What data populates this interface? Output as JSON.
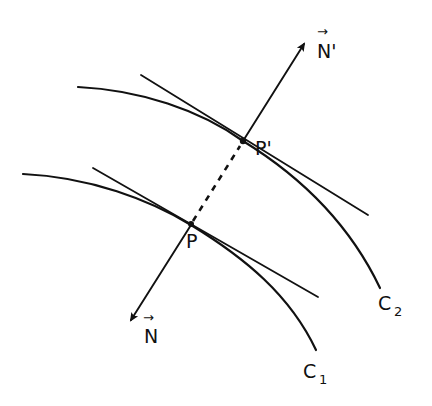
{
  "diagram": {
    "type": "parallel-curves-normals",
    "stroke_color": "#111111",
    "background": "#ffffff",
    "curves": [
      {
        "id": "C1",
        "label": "C",
        "subscript": "1"
      },
      {
        "id": "C2",
        "label": "C",
        "subscript": "2"
      }
    ],
    "points": [
      {
        "id": "P",
        "label": "P"
      },
      {
        "id": "P_prime",
        "label": "P'"
      }
    ],
    "vectors": [
      {
        "id": "N",
        "label": "N",
        "arrow_over": true,
        "direction": "down-left from P"
      },
      {
        "id": "N_prime",
        "label": "N'",
        "arrow_over": true,
        "direction": "up-right from P'"
      }
    ],
    "connections": [
      {
        "from": "P",
        "to": "P'",
        "style": "dashed"
      }
    ],
    "tangents": [
      {
        "at": "P"
      },
      {
        "at": "P'"
      }
    ]
  },
  "labels": {
    "P": "P",
    "P_prime": "P'",
    "N": "N",
    "N_prime": "N'",
    "C1_main": "C",
    "C1_sub": "1",
    "C2_main": "C",
    "C2_sub": "2",
    "arrow_glyph": "→"
  }
}
